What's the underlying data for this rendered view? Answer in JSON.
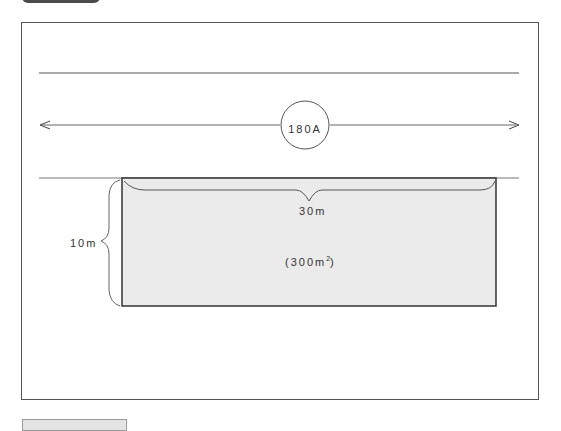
{
  "diagram": {
    "type": "land-parcel-plan",
    "road": {
      "label": "180A",
      "direction": "bidirectional"
    },
    "parcel": {
      "width_label": "30m",
      "depth_label": "10m",
      "area_value": "(300m",
      "area_sup": "2",
      "area_close": ")",
      "fill_color": "#ebebeb",
      "border_color": "#333333"
    },
    "colors": {
      "line": "#555555",
      "frame": "#555555",
      "tab_dark": "#4a4a4a",
      "tab_light": "#e4e4e4"
    }
  }
}
